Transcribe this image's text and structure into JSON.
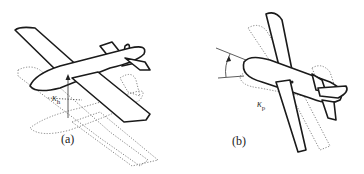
{
  "figure": {
    "panels": [
      {
        "id": "a",
        "label": "(a)",
        "symbol": "κ",
        "subscript": "h",
        "motion": "vertical displacement"
      },
      {
        "id": "b",
        "label": "(b)",
        "symbol": "κ",
        "subscript": "p",
        "motion": "pitch rotation"
      }
    ]
  }
}
